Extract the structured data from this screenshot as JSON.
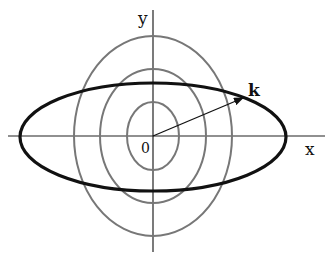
{
  "diagram": {
    "center": {
      "x": 153,
      "y": 136
    },
    "axes": {
      "x_axis": {
        "x1": 8,
        "x2": 325,
        "y": 136,
        "label": "x"
      },
      "y_axis": {
        "x": 153,
        "y1": 10,
        "y2": 252,
        "label": "y"
      },
      "origin_label": "0",
      "color": "#222222"
    },
    "contours": [
      {
        "name": "inner",
        "rx": 26,
        "ry": 34,
        "color": "#777777"
      },
      {
        "name": "middle",
        "rx": 53,
        "ry": 67,
        "color": "#777777"
      },
      {
        "name": "outer",
        "rx": 79,
        "ry": 100,
        "color": "#777777"
      }
    ],
    "constraint_ellipse": {
      "rx": 133,
      "ry": 54,
      "color": "#111111"
    },
    "vector": {
      "label": "k",
      "from": {
        "x": 153,
        "y": 136
      },
      "to": {
        "x": 243,
        "y": 98
      },
      "color": "#111111"
    }
  }
}
